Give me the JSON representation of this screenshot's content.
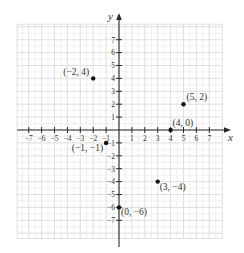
{
  "chart_data": {
    "type": "scatter",
    "title": "",
    "xlabel": "x",
    "ylabel": "y",
    "xlim": [
      -7.9,
      8.0
    ],
    "ylim": [
      -8.4,
      8.2
    ],
    "grid": true,
    "x_ticks": [
      -7,
      -6,
      -5,
      -4,
      -3,
      -2,
      -1,
      1,
      2,
      3,
      4,
      5,
      6,
      7
    ],
    "y_ticks": [
      -7,
      -6,
      -5,
      -4,
      -3,
      -2,
      -1,
      1,
      2,
      3,
      4,
      5,
      6,
      7
    ],
    "x_tick_labels": [
      "−7",
      "−6",
      "−5",
      "−4",
      "−3",
      "−2",
      "−1",
      "1",
      "2",
      "3",
      "4",
      "5",
      "6",
      "7"
    ],
    "y_tick_labels": [
      "−7",
      "−6",
      "−5",
      "−4",
      "−3",
      "−2",
      "−1",
      "1",
      "2",
      "3",
      "4",
      "5",
      "6",
      "7"
    ],
    "points": [
      {
        "x": -2,
        "y": 4,
        "label": "(−2, 4)",
        "label_pos": "left"
      },
      {
        "x": 5,
        "y": 2,
        "label": "(5, 2)",
        "label_pos": "upper-right"
      },
      {
        "x": 4,
        "y": 0,
        "label": "(4, 0)",
        "label_pos": "above"
      },
      {
        "x": -1,
        "y": -1,
        "label": "(−1, −1)",
        "label_pos": "lower-left"
      },
      {
        "x": 3,
        "y": -4,
        "label": "(3, −4)",
        "label_pos": "lower-right"
      },
      {
        "x": 0,
        "y": -6,
        "label": "(0, −6)",
        "label_pos": "lower-right"
      }
    ]
  },
  "colors": {
    "axis": "#2a2a2a",
    "grid_major": "#d8d8d8",
    "grid_minor": "#ececec",
    "point": "#111111",
    "text": "#333333"
  }
}
